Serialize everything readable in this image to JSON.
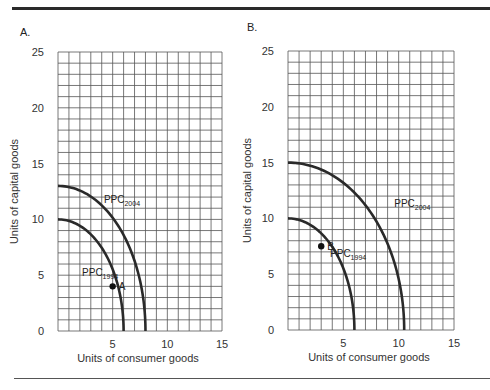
{
  "panels": [
    {
      "id": "A",
      "label": "A."
    },
    {
      "id": "B",
      "label": "B."
    }
  ],
  "chart_data": [
    {
      "type": "line",
      "title": "A.",
      "xlabel": "Units of consumer goods",
      "ylabel": "Units of capital goods",
      "xlim": [
        0,
        15
      ],
      "ylim": [
        0,
        25
      ],
      "xticks": [
        5,
        10,
        15
      ],
      "yticks": [
        0,
        5,
        10,
        15,
        20,
        25
      ],
      "grid": true,
      "grid_step": 1,
      "series": [
        {
          "name": "PPC1994",
          "label_main": "PPC",
          "label_sub": "1994",
          "x_intercept": 6,
          "y_intercept": 10,
          "points": [
            [
              0,
              10
            ],
            [
              2,
              9.3
            ],
            [
              3,
              8.5
            ],
            [
              4,
              7.2
            ],
            [
              5,
              4.1
            ],
            [
              5.6,
              2
            ],
            [
              6,
              0
            ]
          ]
        },
        {
          "name": "PPC2004",
          "label_main": "PPC",
          "label_sub": "2004",
          "x_intercept": 8,
          "y_intercept": 13,
          "points": [
            [
              0,
              13
            ],
            [
              3,
              11.3
            ],
            [
              5,
              9
            ],
            [
              6.5,
              6
            ],
            [
              7.5,
              3
            ],
            [
              8,
              0
            ]
          ]
        }
      ],
      "annotations": [
        {
          "text": "A",
          "x": 5,
          "y": 4,
          "on": "PPC1994"
        }
      ]
    },
    {
      "type": "line",
      "title": "B.",
      "xlabel": "Units of consumer goods",
      "ylabel": "Units of capital goods",
      "xlim": [
        0,
        15
      ],
      "ylim": [
        0,
        25
      ],
      "xticks": [
        5,
        10,
        15
      ],
      "yticks": [
        0,
        5,
        10,
        15,
        20,
        25
      ],
      "grid": true,
      "grid_step": 1,
      "series": [
        {
          "name": "PPC1994",
          "label_main": "PPC",
          "label_sub": "1994",
          "x_intercept": 6,
          "y_intercept": 10,
          "points": [
            [
              0,
              10
            ],
            [
              2,
              8.7
            ],
            [
              3,
              7.5
            ],
            [
              4,
              5.8
            ],
            [
              5,
              3.5
            ],
            [
              6,
              0
            ]
          ]
        },
        {
          "name": "PPC2004",
          "label_main": "PPC",
          "label_sub": "2004",
          "x_intercept": 10.5,
          "y_intercept": 15,
          "points": [
            [
              0,
              15
            ],
            [
              4,
              13.3
            ],
            [
              7,
              10.5
            ],
            [
              9,
              7
            ],
            [
              10,
              3.5
            ],
            [
              10.5,
              0
            ]
          ]
        }
      ],
      "annotations": [
        {
          "text": "B",
          "x": 3,
          "y": 7.5,
          "on": "PPC1994"
        }
      ]
    }
  ]
}
